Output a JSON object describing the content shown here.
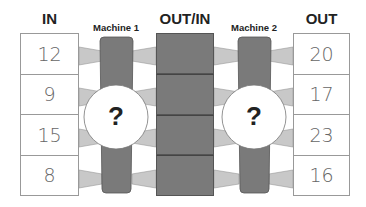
{
  "headers": {
    "in": "IN",
    "machine1": "Machine 1",
    "out_in": "OUT/IN",
    "machine2": "Machine 2",
    "out": "OUT"
  },
  "in_values": [
    "12",
    "9",
    "15",
    "8"
  ],
  "out_values": [
    "20",
    "17",
    "23",
    "16"
  ],
  "machines": [
    {
      "name": "Machine 1",
      "rule": "?"
    },
    {
      "name": "Machine 2",
      "rule": "?"
    }
  ],
  "colors": {
    "machine_body": "#7a7a7a",
    "funnel": "#c8c8c8",
    "middle_column": "#7a7a7a",
    "border": "#999999"
  }
}
